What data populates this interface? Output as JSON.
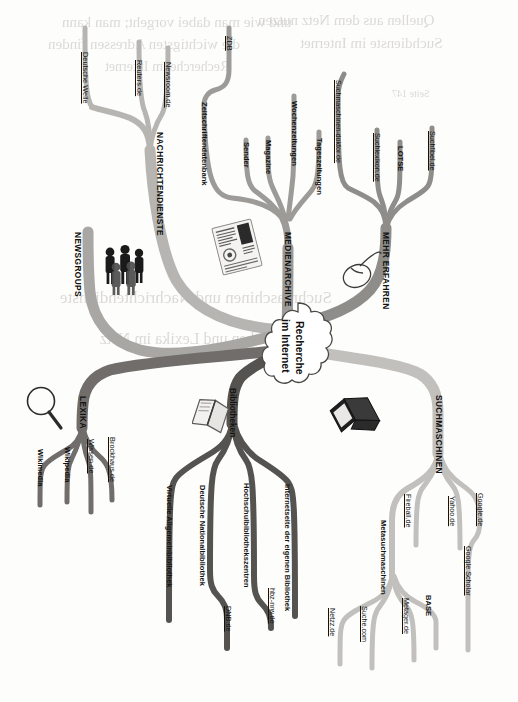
{
  "document": {
    "type": "mind-map",
    "orientation": "rotated-90-clockwise",
    "title": "Recherche im Internet",
    "background_ghost_text": [
      "Wenn Sie wissen wollen, wie Sie im Internet",
      "recherchieren und welche Suchdienste es gibt,",
      "dann finden Sie hier eine Uebersicht dazu.",
      "Seite 147",
      "Recherche im Internet - Suchmaschinen und Nachrichten"
    ]
  },
  "center": {
    "line1": "Recherche",
    "line2": "im Internet"
  },
  "colors": {
    "branch_nachrichtendienste": "#b7b5b1",
    "branch_medienarchive": "#9d9b97",
    "branch_mehr_erfahren": "#8f8d8a",
    "branch_newsgroups": "#a9a7a3",
    "branch_lexika": "#6f6d6a",
    "branch_bibliotheken": "#55534f",
    "branch_suchmaschinen": "#c2c0bc",
    "text": "#131313",
    "page": "#fdfdfc",
    "ghost": "#cfcdc9"
  },
  "branches": [
    {
      "id": "nachrichtendienste",
      "label": "NACHRICHTENDIENSTE",
      "children": [
        {
          "label": "Deutsche Welle",
          "style": "leaf"
        },
        {
          "label": "Reuters.de",
          "style": "leaf"
        },
        {
          "label": "Newsroom.de",
          "style": "leaf"
        }
      ]
    },
    {
      "id": "newsgroups",
      "label": "NEWSGROUPS",
      "children": []
    },
    {
      "id": "medienarchive",
      "label": "MEDIENARCHIVE",
      "children": [
        {
          "label": "Zeitschriftendatenbank",
          "style": "sub",
          "children": [
            {
              "label": "ZDB",
              "style": "leaf"
            }
          ]
        },
        {
          "label": "Sender",
          "style": "sub"
        },
        {
          "label": "Magazine",
          "style": "sub"
        },
        {
          "label": "Wochenzeitungen",
          "style": "sub"
        },
        {
          "label": "Tageszeitungen",
          "style": "sub"
        }
      ]
    },
    {
      "id": "mehr-erfahren",
      "label": "MEHR ERFAHREN",
      "children": [
        {
          "label": "Suchmaschinen-doktor.de",
          "style": "leaf"
        },
        {
          "label": "Suchlexikon.de",
          "style": "leaf"
        },
        {
          "label": "LOTSE",
          "style": "sub"
        },
        {
          "label": "Suchfibel.de",
          "style": "leaf"
        }
      ]
    },
    {
      "id": "lexika",
      "label": "LEXIKA",
      "children": [
        {
          "label": "Wikimedia",
          "style": "sub"
        },
        {
          "label": "Wikipedia",
          "style": "sub"
        },
        {
          "label": "Wissen.de",
          "style": "leaf"
        },
        {
          "label": "Brockhaus.de",
          "style": "leaf"
        }
      ]
    },
    {
      "id": "bibliotheken",
      "label": "Bibliotheken",
      "children": [
        {
          "label": "Virtuelle Allgemeinbibliothek",
          "style": "sub"
        },
        {
          "label": "Deutsche Nationalbibliothek",
          "style": "sub",
          "children": [
            {
              "label": "DNB.de",
              "style": "leaf"
            }
          ]
        },
        {
          "label": "Hochschulbibliothekszentren",
          "style": "sub",
          "children": [
            {
              "label": "hbz-nrw.de",
              "style": "leaf"
            }
          ]
        },
        {
          "label": "Internetseite der eigenen Bibliothek",
          "style": "sub"
        }
      ]
    },
    {
      "id": "suchmaschinen",
      "label": "SUCHMASCHINEN",
      "children": [
        {
          "label": "Metasuchmaschinen",
          "style": "sub",
          "children": [
            {
              "label": "Netzz.de",
              "style": "leaf"
            },
            {
              "label": "Suche.com",
              "style": "leaf"
            },
            {
              "label": "Metager.de",
              "style": "leaf"
            },
            {
              "label": "BASE",
              "style": "sub"
            }
          ]
        },
        {
          "label": "Fireball.de",
          "style": "leaf"
        },
        {
          "label": "Yahoo.de",
          "style": "leaf"
        },
        {
          "label": "Google.de",
          "style": "leaf"
        },
        {
          "label": "Google Scholar",
          "style": "leaf"
        }
      ]
    }
  ],
  "icons": [
    {
      "name": "people-group-icon",
      "near": "NEWSGROUPS"
    },
    {
      "name": "newspaper-icon",
      "near": "MEDIENARCHIVE"
    },
    {
      "name": "computer-mouse-icon",
      "near": "MEHR ERFAHREN"
    },
    {
      "name": "magnifying-glass-icon",
      "near": "LEXIKA"
    },
    {
      "name": "open-book-icon",
      "near": "Bibliotheken"
    },
    {
      "name": "laptop-icon",
      "near": "SUCHMASCHINEN"
    }
  ],
  "labels": {
    "nachrichtendienste": "NACHRICHTENDIENSTE",
    "deutsche_welle": "Deutsche Welle",
    "reuters": "Reuters.de",
    "newsroom": "Newsroom.de",
    "newsgroups": "NEWSGROUPS",
    "medienarchive": "MEDIENARCHIVE",
    "zeitschriftendatenbank": "Zeitschriftendatenbank",
    "zdb": "ZDB",
    "sender": "Sender",
    "magazine": "Magazine",
    "wochenzeitungen": "Wochenzeitungen",
    "tageszeitungen": "Tageszeitungen",
    "mehr_erfahren": "MEHR ERFAHREN",
    "suchmaschinen_doktor": "Suchmaschinen-doktor.de",
    "suchlexikon": "Suchlexikon.de",
    "lotse": "LOTSE",
    "suchfibel": "Suchfibel.de",
    "lexika": "LEXIKA",
    "wikimedia": "Wikimedia",
    "wikipedia": "Wikipedia",
    "wissen": "Wissen.de",
    "brockhaus": "Brockhaus.de",
    "bibliotheken": "Bibliotheken",
    "virtuelle_allgemeinbibliothek": "Virtuelle Allgemeinbibliothek",
    "deutsche_nationalbibliothek": "Deutsche Nationalbibliothek",
    "dnb": "DNB.de",
    "hochschulbibliothekszentren": "Hochschulbibliothekszentren",
    "hbz": "hbz-nrw.de",
    "internetseite_eigene_bibliothek": "Internetseite der eigenen Bibliothek",
    "suchmaschinen": "SUCHMASCHINEN",
    "metasuchmaschinen": "Metasuchmaschinen",
    "netzz": "Netzz.de",
    "suche_com": "Suche.com",
    "metager": "Metager.de",
    "base": "BASE",
    "fireball": "Fireball.de",
    "yahoo": "Yahoo.de",
    "google": "Google.de",
    "google_scholar": "Google Scholar"
  },
  "ghost_lines": [
    {
      "text": "und wie man dabei vorgeht; man kann",
      "x": 62,
      "y": 22,
      "size": 15
    },
    {
      "text": "Quellen aus dem Netz nutzen",
      "x": 250,
      "y": 20,
      "size": 15
    },
    {
      "text": "die wichtigsten Adressen",
      "x": 55,
      "y": 45,
      "size": 15
    },
    {
      "text": "Suchdienste im Internet",
      "x": 300,
      "y": 44,
      "size": 15
    },
    {
      "text": "Recherche im Internet",
      "x": 105,
      "y": 68,
      "size": 14
    },
    {
      "text": "Seite 147",
      "x": 395,
      "y": 95,
      "size": 10
    },
    {
      "text": "Suchmaschinen und Nachrichtendienste",
      "x": 60,
      "y": 300,
      "size": 17
    },
    {
      "text": "Bibliotheken und Lexika im Netz",
      "x": 95,
      "y": 340,
      "size": 16
    }
  ]
}
